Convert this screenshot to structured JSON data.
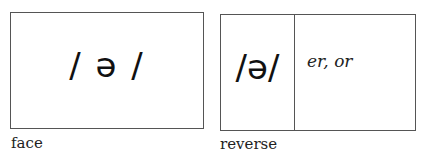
{
  "face": {
    "phoneme": "/ ə /",
    "label": "face"
  },
  "reverse": {
    "phoneme": "/ə/",
    "spellings": "er, or",
    "label": "reverse"
  }
}
